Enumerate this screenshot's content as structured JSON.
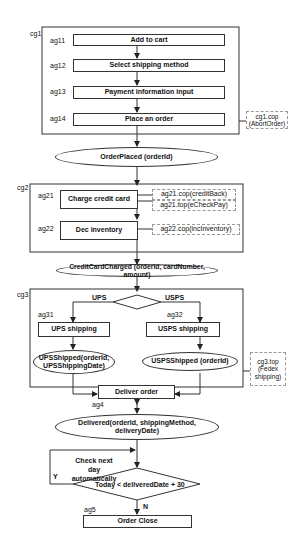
{
  "groups": {
    "cg1": "cg1",
    "cg2": "cg2",
    "cg3": "cg3"
  },
  "cg1": {
    "steps": [
      {
        "id": "ag11",
        "label": "Add to cart"
      },
      {
        "id": "ag12",
        "label": "Select shipping method"
      },
      {
        "id": "ag13",
        "label": "Payment information input"
      },
      {
        "id": "ag14",
        "label": "Place an order"
      }
    ],
    "compensation": "cg1.cop (AbortOrder)"
  },
  "event_order_placed": "OrderPlaced (orderId)",
  "cg2": {
    "steps": [
      {
        "id": "ag21",
        "label": "Charge credit card"
      },
      {
        "id": "ag22",
        "label": "Dec inventory"
      }
    ],
    "ag21_cop": "ag21.cop(creditBack)",
    "ag21_top": "ag21.top(eCheckPay)",
    "ag22_cop": "ag22.cop(incInventory)"
  },
  "event_credit_charged": "CreditCardCharged (orderId, cardNumber, amount)",
  "cg3": {
    "branch_left": "UPS",
    "branch_right": "USPS",
    "left": {
      "id": "ag31",
      "label": "UPS shipping",
      "event": "UPSShipped(orderId, UPSShippingDate)"
    },
    "right": {
      "id": "ag32",
      "label": "USPS shipping",
      "event": "USPSShipped (orderId)"
    },
    "top": "cg3.top (Fedex shipping)"
  },
  "deliver": {
    "id": "ag4",
    "label": "Deliver order"
  },
  "event_delivered": "Delivered(orderId, shippingMethod, deliveryDate)",
  "loop": {
    "note": "Check next day automatically",
    "condition": "Today < deliveredDate + 30",
    "yes": "Y",
    "no": "N"
  },
  "close": {
    "id": "ag5",
    "label": "Order Close"
  }
}
